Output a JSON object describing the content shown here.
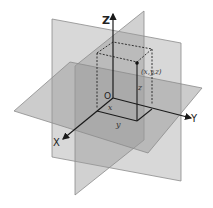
{
  "diagram": {
    "axes": {
      "x": {
        "label": "X"
      },
      "y": {
        "label": "Y"
      },
      "z": {
        "label": "Z"
      }
    },
    "origin_label": "O",
    "point": {
      "label": "(x,y,z)"
    },
    "components": {
      "x": "x",
      "y": "y",
      "z": "z"
    },
    "colors": {
      "plane_fill": "#9a9a9a",
      "plane_stroke": "#8a8a8a",
      "axis": "#1a1a1a",
      "dashed_box": "#222222",
      "background": "#ffffff"
    }
  }
}
